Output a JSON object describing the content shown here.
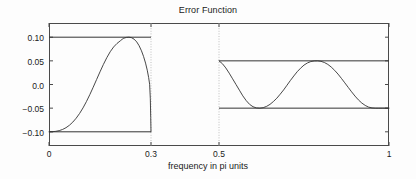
{
  "chart_data": {
    "type": "line",
    "title": "Error Function",
    "xlabel": "frequency in pi units",
    "ylabel": "",
    "xlim": [
      0,
      1
    ],
    "ylim": [
      -0.13,
      0.13
    ],
    "grid": "vertical-dotted",
    "legend": "none",
    "xticks": [
      {
        "value": 0,
        "label": "0"
      },
      {
        "value": 0.3,
        "label": "0.3"
      },
      {
        "value": 0.5,
        "label": "0.5"
      },
      {
        "value": 1,
        "label": "1"
      }
    ],
    "yticks": [
      {
        "value": 0.1,
        "label": "0.10"
      },
      {
        "value": 0.05,
        "label": "0.05"
      },
      {
        "value": 0.0,
        "label": "0.0"
      },
      {
        "value": -0.05,
        "label": "-0.05"
      },
      {
        "value": -0.1,
        "label": "-0.10"
      }
    ],
    "gridlines_x": [
      0.3,
      0.5
    ],
    "tolerance_lines": [
      {
        "name": "passband-upper",
        "y": 0.1,
        "x_start": 0.0,
        "x_end": 0.3
      },
      {
        "name": "passband-lower",
        "y": -0.1,
        "x_start": 0.0,
        "x_end": 0.3
      },
      {
        "name": "stopband-upper",
        "y": 0.05,
        "x_start": 0.5,
        "x_end": 1.0
      },
      {
        "name": "stopband-lower",
        "y": -0.05,
        "x_start": 0.5,
        "x_end": 1.0
      }
    ],
    "series": [
      {
        "name": "passband-error",
        "x_range": [
          0.0,
          0.3
        ],
        "ripple": 0.1,
        "points": [
          [
            0.0,
            -0.1
          ],
          [
            0.01,
            -0.0998
          ],
          [
            0.02,
            -0.099
          ],
          [
            0.03,
            -0.0975
          ],
          [
            0.04,
            -0.095
          ],
          [
            0.05,
            -0.0913
          ],
          [
            0.06,
            -0.0862
          ],
          [
            0.07,
            -0.0795
          ],
          [
            0.08,
            -0.0712
          ],
          [
            0.09,
            -0.0612
          ],
          [
            0.1,
            -0.0495
          ],
          [
            0.11,
            -0.0362
          ],
          [
            0.12,
            -0.0215
          ],
          [
            0.13,
            -0.0058
          ],
          [
            0.14,
            0.0105
          ],
          [
            0.15,
            0.0268
          ],
          [
            0.16,
            0.0424
          ],
          [
            0.17,
            0.0567
          ],
          [
            0.18,
            0.0692
          ],
          [
            0.19,
            0.0793
          ],
          [
            0.2,
            0.0868
          ],
          [
            0.21,
            0.0925
          ],
          [
            0.215,
            0.0955
          ],
          [
            0.22,
            0.0978
          ],
          [
            0.228,
            0.0996
          ],
          [
            0.235,
            0.1
          ],
          [
            0.242,
            0.0992
          ],
          [
            0.25,
            0.096
          ],
          [
            0.258,
            0.09
          ],
          [
            0.265,
            0.082
          ],
          [
            0.272,
            0.0712
          ],
          [
            0.278,
            0.0595
          ],
          [
            0.284,
            0.0452
          ],
          [
            0.289,
            0.0302
          ],
          [
            0.293,
            0.015
          ],
          [
            0.296,
            0.0005
          ],
          [
            0.298,
            -0.03
          ],
          [
            0.2992,
            -0.07
          ],
          [
            0.3,
            -0.1
          ]
        ]
      },
      {
        "name": "stopband-error",
        "x_range": [
          0.5,
          1.0
        ],
        "ripple": 0.05,
        "points": [
          [
            0.5,
            0.05
          ],
          [
            0.51,
            0.044
          ],
          [
            0.52,
            0.035
          ],
          [
            0.53,
            0.024
          ],
          [
            0.54,
            0.012
          ],
          [
            0.55,
            0.0
          ],
          [
            0.56,
            -0.012
          ],
          [
            0.57,
            -0.024
          ],
          [
            0.58,
            -0.034
          ],
          [
            0.59,
            -0.042
          ],
          [
            0.6,
            -0.047
          ],
          [
            0.61,
            -0.0495
          ],
          [
            0.62,
            -0.05
          ],
          [
            0.63,
            -0.049
          ],
          [
            0.64,
            -0.0462
          ],
          [
            0.65,
            -0.042
          ],
          [
            0.66,
            -0.036
          ],
          [
            0.67,
            -0.029
          ],
          [
            0.68,
            -0.0205
          ],
          [
            0.69,
            -0.0115
          ],
          [
            0.7,
            -0.0015
          ],
          [
            0.71,
            0.0085
          ],
          [
            0.72,
            0.018
          ],
          [
            0.73,
            0.027
          ],
          [
            0.74,
            0.0345
          ],
          [
            0.75,
            0.041
          ],
          [
            0.76,
            0.0455
          ],
          [
            0.77,
            0.0485
          ],
          [
            0.78,
            0.0498
          ],
          [
            0.79,
            0.05
          ],
          [
            0.8,
            0.049
          ],
          [
            0.81,
            0.0465
          ],
          [
            0.82,
            0.0425
          ],
          [
            0.83,
            0.037
          ],
          [
            0.84,
            0.03
          ],
          [
            0.85,
            0.022
          ],
          [
            0.86,
            0.013
          ],
          [
            0.87,
            0.0035
          ],
          [
            0.88,
            -0.006
          ],
          [
            0.89,
            -0.0155
          ],
          [
            0.9,
            -0.0245
          ],
          [
            0.91,
            -0.0325
          ],
          [
            0.92,
            -0.0392
          ],
          [
            0.93,
            -0.0442
          ],
          [
            0.94,
            -0.0478
          ],
          [
            0.95,
            -0.0495
          ],
          [
            0.96,
            -0.05
          ],
          [
            0.97,
            -0.05
          ],
          [
            0.98,
            -0.05
          ],
          [
            0.99,
            -0.05
          ],
          [
            1.0,
            -0.05
          ]
        ]
      }
    ]
  },
  "colors": {
    "axis": "#4a4a4a",
    "curve": "#333333",
    "gridline": "#bfbfbf",
    "text": "#1a1a1a",
    "background": "#fdfdfd"
  }
}
